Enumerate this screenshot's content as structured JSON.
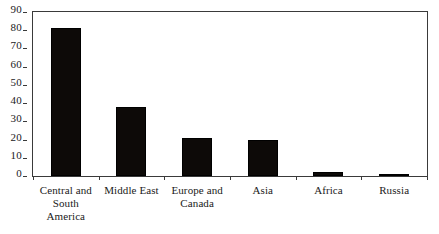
{
  "chart_data": {
    "type": "bar",
    "title": "",
    "subtitle": "",
    "xlabel": "",
    "ylabel": "",
    "categories": [
      "Central and South America",
      "Middle East",
      "Europe and Canada",
      "Asia",
      "Africa",
      "Russia"
    ],
    "values": [
      81,
      38,
      21,
      19.5,
      2,
      1
    ],
    "ylim": [
      0,
      90
    ],
    "ytick_values": [
      0,
      10,
      20,
      30,
      40,
      50,
      60,
      70,
      80,
      90
    ],
    "ytick_labels": [
      "0",
      "10",
      "20",
      "30",
      "40",
      "50",
      "60",
      "70",
      "80",
      "90"
    ],
    "grid": false,
    "legend": false,
    "legend_position": "none",
    "bar_color": "#0d0a08",
    "frame_color": "#3a3a3a",
    "background_color": "#ffffff"
  }
}
